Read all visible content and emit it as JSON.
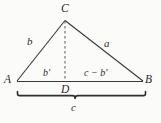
{
  "figure": {
    "type": "geometry-diagram",
    "stroke_color": "#3a3a3a",
    "background_color": "#fbfbfa",
    "vertices": [
      {
        "name": "A",
        "label": "A",
        "x": 17,
        "y": 81
      },
      {
        "name": "B",
        "label": "B",
        "x": 143,
        "y": 81
      },
      {
        "name": "C",
        "label": "C",
        "x": 65,
        "y": 20
      },
      {
        "name": "D",
        "label": "D",
        "x": 65,
        "y": 81
      }
    ],
    "edges": [
      {
        "name": "side-AC",
        "label": "b",
        "from": "A",
        "to": "C",
        "style": "solid"
      },
      {
        "name": "side-CB",
        "label": "a",
        "from": "C",
        "to": "B",
        "style": "solid"
      },
      {
        "name": "base-AB",
        "label": "c",
        "from": "A",
        "to": "B",
        "style": "solid"
      },
      {
        "name": "altitude-CD",
        "label": "",
        "from": "C",
        "to": "D",
        "style": "dashed"
      }
    ],
    "segment_labels": [
      {
        "name": "segment-AD",
        "label": "b'"
      },
      {
        "name": "segment-DB",
        "label": "c − b'"
      }
    ],
    "brace": {
      "name": "base-brace",
      "label": "c",
      "x_start": 17,
      "x_end": 146,
      "y": 94
    }
  }
}
